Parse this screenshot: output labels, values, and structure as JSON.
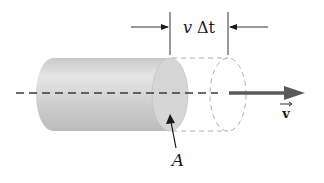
{
  "diagram": {
    "dimension_label": {
      "var": "v",
      "delta": "Δt"
    },
    "area_label": "A",
    "velocity_label": "v",
    "colors": {
      "cylinder_light": "#e2e2e2",
      "cylinder_dark": "#bdbdbd",
      "face": "#d4d4d4",
      "dashed_outline": "#b0b0b0",
      "axis_line": "#3a3a3a",
      "velocity_arrow": "#5a5a5a",
      "text": "#1a1a1a"
    }
  }
}
